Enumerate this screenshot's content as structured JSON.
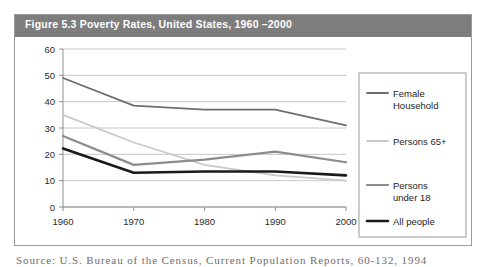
{
  "figure": {
    "title": "Figure 5.3 Poverty Rates, United States, 1960 –2000",
    "source_note": "Source: U.S. Bureau of the Census, Current Population Reports, 60-132, 1994",
    "title_band_color": "#7d7d7d",
    "border_color": "#9a9a9a",
    "background": "#ffffff"
  },
  "chart_data": {
    "type": "line",
    "title": "Figure 5.3 Poverty Rates, United States, 1960 –2000",
    "xlabel": "",
    "ylabel": "",
    "x": [
      1960,
      1970,
      1980,
      1990,
      2000
    ],
    "categories": [
      "1960",
      "1970",
      "1980",
      "1990",
      "2000"
    ],
    "xlim": [
      1960,
      2000
    ],
    "ylim": [
      0,
      60
    ],
    "yticks": [
      0,
      10,
      20,
      30,
      40,
      50,
      60
    ],
    "ytick_labels": [
      "0",
      "10",
      "20",
      "30",
      "40",
      "50",
      "60"
    ],
    "xtick_labels": [
      "1960",
      "1970",
      "1980",
      "1990",
      "2000"
    ],
    "grid": "horizontal",
    "legend_position": "right",
    "series": [
      {
        "name": "Female Household",
        "values": [
          49,
          38.5,
          37,
          37,
          31
        ],
        "color": "#6e6e6e",
        "width": 1.8
      },
      {
        "name": "Persons 65+",
        "values": [
          35,
          24.5,
          16,
          12,
          10
        ],
        "color": "#c9c9c9",
        "width": 1.8
      },
      {
        "name": "Persons under 18",
        "values": [
          27,
          16,
          18,
          21,
          17
        ],
        "color": "#8c8c8c",
        "width": 2.2
      },
      {
        "name": "All people",
        "values": [
          22.2,
          13,
          13.5,
          13.5,
          12
        ],
        "color": "#1a1a1a",
        "width": 2.6
      }
    ]
  },
  "legend": {
    "entries": [
      {
        "label_line1": "Female",
        "label_line2": "Household",
        "color": "#6e6e6e",
        "width": 1.8
      },
      {
        "label_line1": "Persons 65+",
        "label_line2": "",
        "color": "#c9c9c9",
        "width": 1.8
      },
      {
        "label_line1": "Persons",
        "label_line2": "under 18",
        "color": "#8c8c8c",
        "width": 2.2
      },
      {
        "label_line1": "All people",
        "label_line2": "",
        "color": "#1a1a1a",
        "width": 2.6
      }
    ],
    "border_color": "#9a9a9a"
  }
}
